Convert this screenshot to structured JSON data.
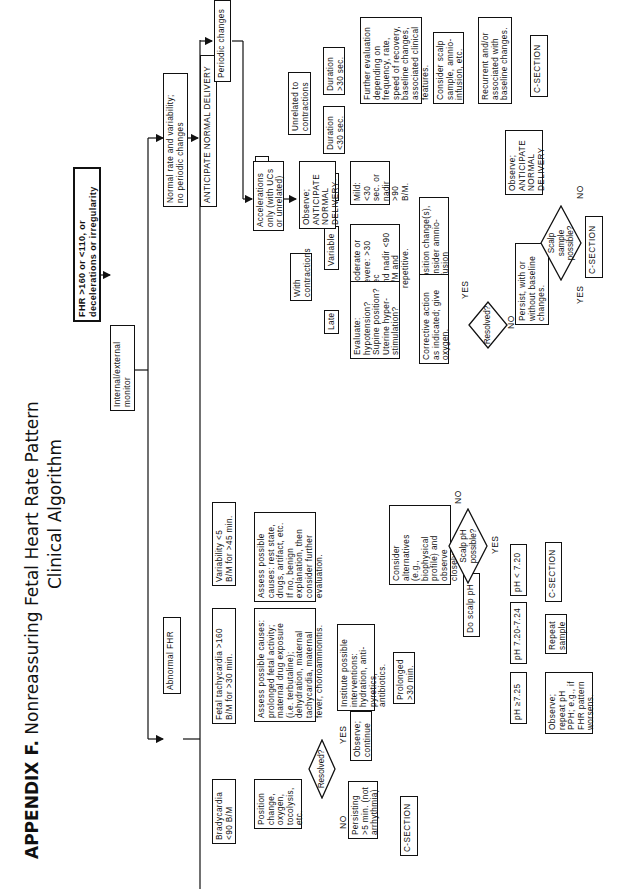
{
  "title": {
    "prefix": "APPENDIX F.",
    "main": "Nonreassuring Fetal Heart Rate Pattern",
    "sub": "Clinical Algorithm"
  },
  "nodes": {
    "start": "FHR >160 or <110, or\ndecelerations or irregularity",
    "monitor": "Internal/external\nmonitor",
    "normal": "Normal rate and variability;\nno periodic changes",
    "anticipate_normal": "ANTICIPATE NORMAL DELIVERY",
    "periodic": "Periodic changes",
    "decelerations": "Decelerations",
    "unrelated": "Unrelated to\ncontractions",
    "dur_gt30": "Duration\n>30 sec.",
    "dur_lt30": "Duration\n<30 sec.",
    "further_eval": "Further evaluation\ndepending on\nfrequency, rate,\nspeed of recovery,\nbaseline changes,\nassociated clinical\nfeatures.",
    "consider_scalp": "Consider scalp\nsample, amnio-\ninfusion, etc.",
    "recurrent": "Recurrent and/or\nassociated with\nbaseline changes.",
    "csection_top": "C-SECTION",
    "with_contractions": "With\ncontractions",
    "early": "Early",
    "mild": "Mild: <30\nsec. or\nnadir >90\nB/M.",
    "variable": "Variable",
    "moderate": "Moderate or\nsevere: >30 sec\nand nadir <90\nB/M and\nrepetitive.",
    "late": "Late",
    "evaluate": "Evaluate:\nhypotension?\nSupine position?\nUterine hyper-\nstimulation?",
    "position_change": "Position change(s),\nconsider amnio-\ninfusion",
    "corrective": "Corrective action\nas indicated; give\noxygen.",
    "observe_anticipate_right": "Observe;\nANTICIPATE\nNORMAL\nDELIVERY",
    "resolved_mid": "Resolved?",
    "persist": "Persist, with or\nwithout baseline\nchanges.",
    "scalp_sample": "Scalp\nsample\npossible?",
    "csection_right": "C-SECTION",
    "accelerations": "Accelerations\nonly (with UCs\nor unrelated)",
    "observe_anticipate_mid": "Observe;\nANTICIPATE\nNORMAL\nDELIVERY",
    "abnormal": "Abnormal FHR",
    "variability": "Variability <5\nB/M for >45 min.",
    "assess_var": "Assess possible\ncauses: rest state,\ndrugs, artifact, etc.\nIf no, benign\nexplanation, then\nconsider further\nevaluation.",
    "tachy": "Fetal tachycardia >160\nB/M for >30 min.",
    "assess_tachy": "Assess possible causes:\nprolonged fetal activity;\nmaternal drug exposure\n(i.e. terbutaline);\ndehydration, maternal\ntachycardia, maternal\nfever, chorioamnionitis.",
    "institute": "Institute possible\ninterventions:\nhydration, anti-\npyretics, antibiotics.",
    "prolonged": "Prolonged\n>30 min.",
    "scalp_ph_possible": "Scalp pH\npossible?",
    "consider_alt": "Consider\nalternatives\n(e.g.,\nbiophysical\nprofile) and\nobserve\nclosely.",
    "do_scalp": "Do scalp pH",
    "ph_lt720": "pH < 7.20",
    "csection_ph": "C-SECTION",
    "ph_720_724": "pH 7.20-7.24",
    "repeat": "Repeat\nsample",
    "ph_ge725": "pH ≥7.25",
    "observe_repeat": "Observe;\nrepeat pH\nPPH; e.g., if\nFHR pattern\nworsens.",
    "brady": "Bradycardia\n<90 B/M",
    "position_brady": "Position\nchange,\noxygen,\ntocolysis,\netc.",
    "resolved_brady": "Resolved?",
    "observe_continue": "Observe;\ncontinue",
    "persisting": "Persisting\n>5 min. (not\narrhythmia)",
    "csection_brady": "C-SECTION"
  },
  "labels": {
    "yes": "YES",
    "no": "NO"
  }
}
